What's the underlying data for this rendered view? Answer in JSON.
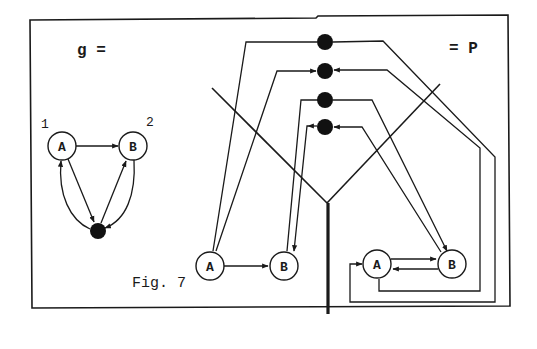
{
  "figure": {
    "caption": "Fig. 7",
    "left_label": "g =",
    "right_label": "= P"
  },
  "graph_g": {
    "nodes": [
      {
        "id": "A",
        "label": "A",
        "index_label": "1"
      },
      {
        "id": "B",
        "label": "B",
        "index_label": "2"
      }
    ],
    "hub": "black-dot"
  },
  "graph_p": {
    "left_nodes": [
      {
        "id": "A",
        "label": "A"
      },
      {
        "id": "B",
        "label": "B"
      }
    ],
    "right_nodes": [
      {
        "id": "A",
        "label": "A"
      },
      {
        "id": "B",
        "label": "B"
      }
    ],
    "black_dots": 4
  },
  "colors": {
    "ink": "#1a1a1a",
    "background": "#ffffff"
  }
}
